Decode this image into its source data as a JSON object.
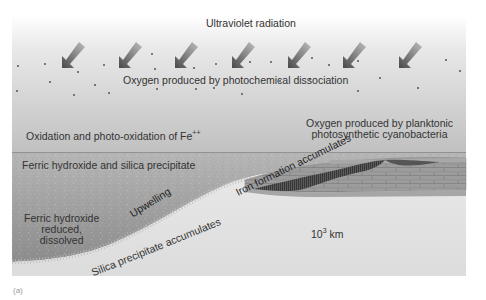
{
  "diagram": {
    "labels": {
      "ultraviolet": "Ultraviolet radiation",
      "oxygen_photochemical": "Oxygen produced by photochemical dissociation",
      "oxidation": "Oxidation and photo-oxidation of Fe",
      "oxidation_sup": "++",
      "oxygen_planktonic_1": "Oxygen produced by planktonic",
      "oxygen_planktonic_2": "photosynthetic cyanobacteria",
      "ferric_precipitate": "Ferric hydroxide and silica precipitate",
      "ferric_reduced_1": "Ferric hydroxide",
      "ferric_reduced_2": "reduced,",
      "ferric_reduced_3": "dissolved",
      "upwelling": "Upwelling",
      "iron_formation": "Iron formation accumulates",
      "silica_accumulates": "Silica precipitate accumulates",
      "scale_base": "10",
      "scale_exp": "3",
      "scale_unit": " km"
    },
    "panel_label": "(a)",
    "colors": {
      "sky_top": "#ffffff",
      "sky_bottom": "#bdbdbd",
      "ocean_top": "#b2b2b2",
      "ocean_bottom": "#8e8e8e",
      "seafloor": "#e4e4e4",
      "iron_formation": "#4a4a4a",
      "layers": "#9a9a9a",
      "uv_arrow": "#555555",
      "upwelling_arrow": "#444444"
    },
    "icons": {
      "uv_arrows": "arrow-down-left",
      "precipitate_arrows": "squiggle-arrow-down",
      "upwelling_arrow": "arrow-up-right",
      "scale_bar": "double-arrow-horizontal"
    }
  }
}
